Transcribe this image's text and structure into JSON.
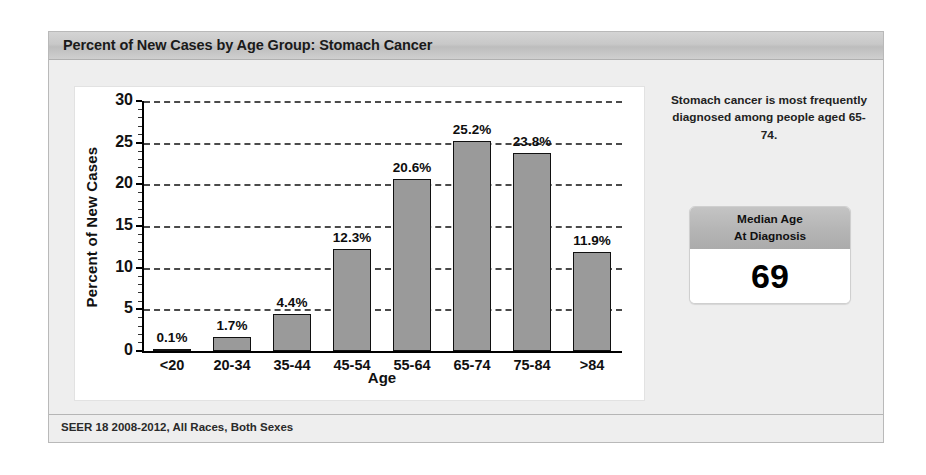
{
  "panel": {
    "title": "Percent of New Cases by Age Group: Stomach Cancer",
    "footer": "SEER 18 2008-2012, All Races, Both Sexes"
  },
  "side": {
    "note": "Stomach cancer is most frequently diagnosed among people aged 65-74.",
    "median_label_line1": "Median Age",
    "median_label_line2": "At Diagnosis",
    "median_value": "69"
  },
  "colors": {
    "bar_fill": "#9a9a9a",
    "bar_stroke": "#111111",
    "panel_bg": "#eeeeee",
    "title_bar": "#c8c8c8",
    "plot_bg": "#ffffff",
    "gridline": "#4a4a4a"
  },
  "chart_data": {
    "type": "bar",
    "title": "Percent of New Cases by Age Group: Stomach Cancer",
    "xlabel": "Age",
    "ylabel": "Percent of New Cases",
    "categories": [
      "<20",
      "20-34",
      "35-44",
      "45-54",
      "55-64",
      "65-74",
      "75-84",
      ">84"
    ],
    "values": [
      0.1,
      1.7,
      4.4,
      12.3,
      20.6,
      25.2,
      23.8,
      11.9
    ],
    "value_labels": [
      "0.1%",
      "1.7%",
      "4.4%",
      "12.3%",
      "20.6%",
      "25.2%",
      "23.8%",
      "11.9%"
    ],
    "ylim": [
      0,
      30
    ],
    "yticks": [
      0,
      5,
      10,
      15,
      20,
      25,
      30
    ],
    "ytick_labels": [
      "0",
      "5",
      "10",
      "15",
      "20",
      "25",
      "30"
    ],
    "grid": true,
    "grid_axis": "y",
    "legend": false,
    "source": "SEER 18 2008-2012, All Races, Both Sexes"
  }
}
